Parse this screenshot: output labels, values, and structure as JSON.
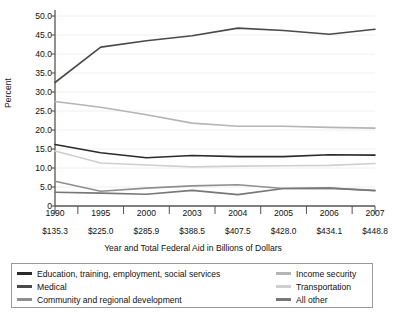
{
  "chart_data": {
    "type": "line",
    "title": "",
    "xlabel": "Year and Total Federal Aid in Billions of Dollars",
    "ylabel": "Percent",
    "categories": [
      "1990",
      "1995",
      "2000",
      "2003",
      "2004",
      "2005",
      "2006",
      "2007"
    ],
    "category_sublabels": [
      "$135.3",
      "$225.0",
      "$285.9",
      "$388.5",
      "$407.5",
      "$428.0",
      "$434.1",
      "$448.8"
    ],
    "ylim": [
      0,
      50
    ],
    "yticks": [
      "0",
      "5.0",
      "10.0",
      "15.0",
      "20.0",
      "25.0",
      "30.0",
      "35.0",
      "40.0",
      "45.0",
      "50.0"
    ],
    "ytick_values": [
      0,
      5,
      10,
      15,
      20,
      25,
      30,
      35,
      40,
      45,
      50
    ],
    "grid": true,
    "legend_position": "bottom",
    "series": [
      {
        "name": "Education, training, employment, social services",
        "color": "#2b2b2b",
        "values": [
          16.2,
          14.0,
          12.7,
          13.3,
          13.0,
          13.0,
          13.5,
          13.4
        ]
      },
      {
        "name": "Medical",
        "color": "#4a4a4a",
        "values": [
          32.5,
          41.8,
          43.5,
          44.8,
          46.8,
          46.2,
          45.2,
          46.5
        ]
      },
      {
        "name": "Community and regional development",
        "color": "#8f8f8f",
        "values": [
          6.5,
          3.9,
          4.7,
          5.3,
          5.6,
          4.6,
          4.7,
          4.1
        ]
      },
      {
        "name": "Income security",
        "color": "#b5b5b5",
        "values": [
          27.5,
          26.0,
          24.0,
          21.8,
          21.0,
          21.0,
          20.7,
          20.5
        ]
      },
      {
        "name": "Transportation",
        "color": "#cfcfcf",
        "values": [
          14.5,
          11.3,
          10.8,
          10.3,
          10.5,
          10.6,
          10.7,
          11.2
        ]
      },
      {
        "name": "All other",
        "color": "#777777",
        "values": [
          3.6,
          3.4,
          3.1,
          4.1,
          3.0,
          4.6,
          4.7,
          4.0
        ]
      }
    ],
    "legend": {
      "left_column": [
        "Education, training, employment, social services",
        "Medical",
        "Community and regional development"
      ],
      "right_column": [
        "Income security",
        "Transportation",
        "All other"
      ]
    }
  }
}
